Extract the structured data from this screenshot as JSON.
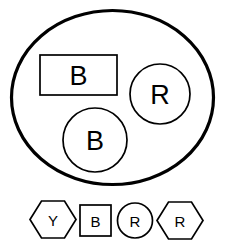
{
  "diagram": {
    "stroke_color": "#000000",
    "fill_color": "#ffffff",
    "container": {
      "shape": "ellipse",
      "label": ""
    },
    "contained_items": [
      {
        "shape": "rectangle",
        "label": "B"
      },
      {
        "shape": "circle",
        "label": "R"
      },
      {
        "shape": "circle",
        "label": "B"
      }
    ],
    "legend_items": [
      {
        "shape": "hexagon",
        "label": "Y"
      },
      {
        "shape": "square",
        "label": "B"
      },
      {
        "shape": "circle",
        "label": "R"
      },
      {
        "shape": "hexagon",
        "label": "R"
      }
    ]
  }
}
